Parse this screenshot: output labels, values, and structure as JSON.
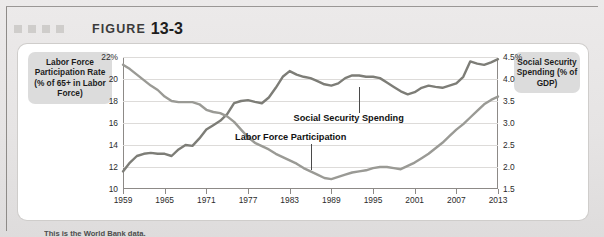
{
  "header": {
    "figure_label": "FIGURE",
    "figure_number": "13-3",
    "decor_squares": 4,
    "decor_icon": "square-marker-icon"
  },
  "axis_titles": {
    "left": "Labor Force Participation Rate (% of 65+ in Labor Force)",
    "right": "Social Security Spending (% of GDP)"
  },
  "annotations": {
    "social_security": "Social Security Spending",
    "labor_force": "Labor Force Participation"
  },
  "caption": "This is the World Bank data.",
  "colors": {
    "series_labor_force": "#9a9a95",
    "series_social_security": "#7d7d77",
    "axis": "#8d8a87",
    "gridline": "#dddbd9",
    "label_box": "#dcdcdc",
    "mat": "#e6e4e4",
    "card": "#ffffff"
  },
  "chart_data": {
    "type": "line",
    "title": "FIGURE 13-3",
    "xlabel": "",
    "grid": true,
    "legend_position": "inline-annotations",
    "x_ticks": [
      "1959",
      "1965",
      "1971",
      "1977",
      "1983",
      "1989",
      "1995",
      "2001",
      "2007",
      "2013"
    ],
    "xlim": [
      1959,
      2013
    ],
    "left_axis": {
      "label": "Labor Force Participation Rate (% of 65+ in Labor Force)",
      "ylim": [
        10,
        22
      ],
      "ticks": [
        "22%",
        "20",
        "18",
        "16",
        "14",
        "12",
        "10"
      ],
      "tick_values": [
        22,
        20,
        18,
        16,
        14,
        12,
        10
      ]
    },
    "right_axis": {
      "label": "Social Security Spending (% of GDP)",
      "ylim": [
        1.5,
        4.5
      ],
      "ticks": [
        "4.5%",
        "4.0",
        "3.5",
        "3.0",
        "2.5",
        "2.0",
        "1.5"
      ],
      "tick_values": [
        4.5,
        4.0,
        3.5,
        3.0,
        2.5,
        2.0,
        1.5
      ]
    },
    "x": [
      1959,
      1960,
      1961,
      1962,
      1963,
      1964,
      1965,
      1966,
      1967,
      1968,
      1969,
      1970,
      1971,
      1972,
      1973,
      1974,
      1975,
      1976,
      1977,
      1978,
      1979,
      1980,
      1981,
      1982,
      1983,
      1984,
      1985,
      1986,
      1987,
      1988,
      1989,
      1990,
      1991,
      1992,
      1993,
      1994,
      1995,
      1996,
      1997,
      1998,
      1999,
      2000,
      2001,
      2002,
      2003,
      2004,
      2005,
      2006,
      2007,
      2008,
      2009,
      2010,
      2011,
      2012,
      2013
    ],
    "series": [
      {
        "name": "Labor Force Participation",
        "axis": "left",
        "unit": "% of 65+ in Labor Force",
        "color": "#9a9a95",
        "values": [
          21.3,
          20.9,
          20.4,
          19.9,
          19.4,
          19.0,
          18.4,
          18.0,
          17.9,
          17.9,
          17.9,
          17.7,
          17.2,
          17.0,
          16.9,
          16.6,
          16.1,
          15.4,
          14.7,
          14.2,
          13.9,
          13.6,
          13.2,
          12.9,
          12.6,
          12.3,
          11.9,
          11.6,
          11.3,
          11.0,
          10.9,
          11.1,
          11.3,
          11.5,
          11.6,
          11.7,
          11.9,
          12.0,
          12.0,
          11.9,
          11.8,
          12.1,
          12.4,
          12.8,
          13.2,
          13.7,
          14.2,
          14.8,
          15.4,
          15.9,
          16.5,
          17.1,
          17.7,
          18.1,
          18.4
        ]
      },
      {
        "name": "Social Security Spending",
        "axis": "right",
        "unit": "% of GDP",
        "color": "#7d7d77",
        "values": [
          1.9,
          2.1,
          2.25,
          2.3,
          2.32,
          2.3,
          2.3,
          2.25,
          2.4,
          2.5,
          2.48,
          2.65,
          2.85,
          2.95,
          3.05,
          3.2,
          3.45,
          3.5,
          3.52,
          3.48,
          3.45,
          3.58,
          3.8,
          4.05,
          4.18,
          4.1,
          4.05,
          4.02,
          3.95,
          3.88,
          3.85,
          3.9,
          4.02,
          4.08,
          4.08,
          4.05,
          4.05,
          4.02,
          3.92,
          3.82,
          3.72,
          3.65,
          3.7,
          3.8,
          3.85,
          3.82,
          3.8,
          3.85,
          3.9,
          4.05,
          4.4,
          4.35,
          4.32,
          4.38,
          4.45
        ]
      }
    ]
  }
}
